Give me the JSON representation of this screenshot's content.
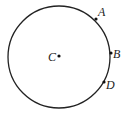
{
  "diagram": {
    "type": "circle-with-points",
    "circle": {
      "cx": 59,
      "cy": 57,
      "r": 51,
      "stroke": "#222222"
    },
    "points": [
      {
        "label": "C",
        "x": 59,
        "y": 56,
        "label_x": 48,
        "label_y": 61,
        "role": "center"
      },
      {
        "label": "A",
        "x": 96,
        "y": 19,
        "label_x": 98,
        "label_y": 16
      },
      {
        "label": "B",
        "x": 111,
        "y": 53,
        "label_x": 113,
        "label_y": 58
      },
      {
        "label": "D",
        "x": 104,
        "y": 82,
        "label_x": 106,
        "label_y": 89
      }
    ]
  }
}
